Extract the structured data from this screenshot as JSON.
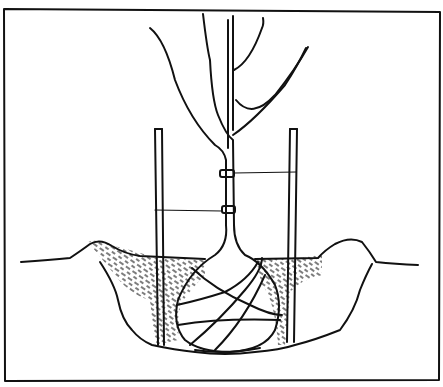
{
  "illustration": {
    "subject": "tree-planting-with-stakes",
    "elements": [
      "frame",
      "sapling",
      "stakes",
      "ties",
      "root-ball",
      "burlap-wrapping",
      "planting-hole",
      "backfill-soil"
    ],
    "colors": {
      "ink": "#111111",
      "paper": "#ffffff"
    }
  }
}
